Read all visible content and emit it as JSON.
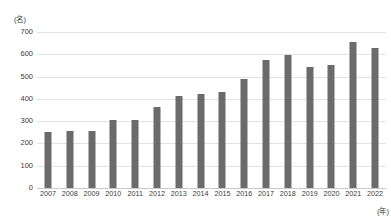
{
  "chart_data": {
    "type": "bar",
    "title": "",
    "xlabel": "(年)",
    "ylabel": "(名)",
    "categories": [
      "2007",
      "2008",
      "2009",
      "2010",
      "2011",
      "2012",
      "2013",
      "2014",
      "2015",
      "2016",
      "2017",
      "2018",
      "2019",
      "2020",
      "2021",
      "2022"
    ],
    "values": [
      253,
      258,
      258,
      305,
      303,
      365,
      415,
      420,
      430,
      490,
      575,
      595,
      545,
      550,
      655,
      630
    ],
    "ylim": [
      0,
      700
    ],
    "ytick_values": [
      0,
      100,
      200,
      300,
      400,
      500,
      600,
      700
    ],
    "ytick_labels": [
      "0",
      "100",
      "200",
      "300",
      "400",
      "500",
      "600",
      "700"
    ],
    "grid": true,
    "legend": false,
    "series_color": "#6b6b6b",
    "gridline_color": "#e2e2e2"
  }
}
